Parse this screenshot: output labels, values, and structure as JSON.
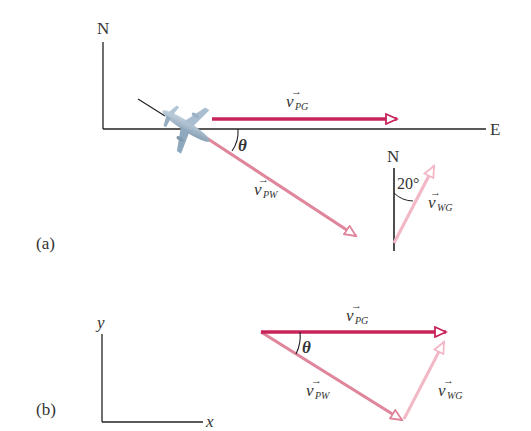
{
  "figure": {
    "panel_a": {
      "label": "(a)",
      "axis_north": "N",
      "axis_east": "E",
      "angle_label": "θ",
      "v_pg": {
        "symbol": "v",
        "subscript": "PG"
      },
      "v_pw": {
        "symbol": "v",
        "subscript": "PW"
      },
      "wind_inset": {
        "north_label": "N",
        "angle_label": "20°",
        "v_wg": {
          "symbol": "v",
          "subscript": "WG"
        }
      },
      "airplane_icon": "airplane-icon"
    },
    "panel_b": {
      "label": "(b)",
      "axis_x": "x",
      "axis_y": "y",
      "angle_label": "θ",
      "v_pg": {
        "symbol": "v",
        "subscript": "PG"
      },
      "v_pw": {
        "symbol": "v",
        "subscript": "PW"
      },
      "v_wg": {
        "symbol": "v",
        "subscript": "WG"
      }
    },
    "colors": {
      "v_pg": "#c8245a",
      "v_pw": "#e0869c",
      "v_wg": "#f2b8c6",
      "axes": "#222222",
      "text": "#333333"
    }
  }
}
